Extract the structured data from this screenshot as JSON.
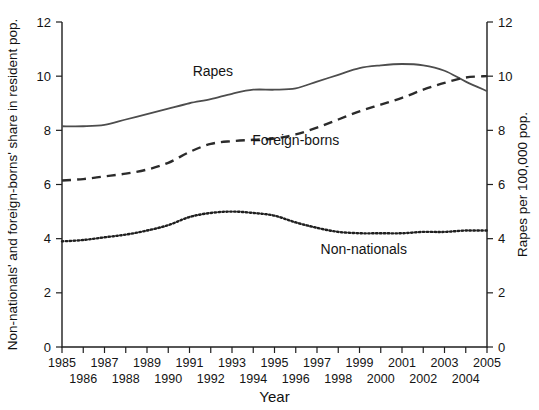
{
  "chart_data": {
    "type": "line",
    "title": "",
    "xlabel": "Year",
    "ylabel": "Non-nationals' and foreign-borns' share in resident pop.",
    "ylabel_right": "Rapes per 100,000 pop.",
    "grid": false,
    "legend_position": "inline-annotations",
    "xlim": [
      1985,
      2005
    ],
    "ylim": [
      0,
      12
    ],
    "ylim_right": [
      0,
      12
    ],
    "yticks": [
      0,
      2,
      4,
      6,
      8,
      10,
      12
    ],
    "yticks_right": [
      0,
      2,
      4,
      6,
      8,
      10,
      12
    ],
    "x": [
      1985,
      1986,
      1987,
      1988,
      1989,
      1990,
      1991,
      1992,
      1993,
      1994,
      1995,
      1996,
      1997,
      1998,
      1999,
      2000,
      2001,
      2002,
      2003,
      2004,
      2005
    ],
    "xticklabels_top": [
      "1985",
      "",
      "1987",
      "",
      "1989",
      "",
      "1991",
      "",
      "1993",
      "",
      "1995",
      "",
      "1997",
      "",
      "1999",
      "",
      "2001",
      "",
      "2003",
      "",
      "2005"
    ],
    "xticklabels_bottom": [
      "",
      "1986",
      "",
      "1988",
      "",
      "1990",
      "",
      "1992",
      "",
      "1994",
      "",
      "1996",
      "",
      "1998",
      "",
      "2000",
      "",
      "2002",
      "",
      "2004",
      ""
    ],
    "series": [
      {
        "name": "Rapes",
        "style": "solid",
        "axis": "right",
        "color": "#4d4d4d",
        "values": [
          8.15,
          8.15,
          8.2,
          8.4,
          8.6,
          8.8,
          9.0,
          9.15,
          9.35,
          9.5,
          9.5,
          9.55,
          9.8,
          10.05,
          10.3,
          10.4,
          10.45,
          10.4,
          10.2,
          9.8,
          9.45
        ]
      },
      {
        "name": "Foreign-borns",
        "style": "dashed",
        "axis": "left",
        "color": "#2b2b2b",
        "values": [
          6.15,
          6.2,
          6.3,
          6.4,
          6.55,
          6.8,
          7.2,
          7.5,
          7.6,
          7.65,
          7.7,
          7.85,
          8.1,
          8.4,
          8.7,
          8.95,
          9.2,
          9.5,
          9.75,
          9.95,
          10.0
        ]
      },
      {
        "name": "Non-nationals",
        "style": "dotted",
        "axis": "left",
        "color": "#1f1f1f",
        "values": [
          3.9,
          3.95,
          4.05,
          4.15,
          4.3,
          4.5,
          4.8,
          4.95,
          5.0,
          4.95,
          4.85,
          4.6,
          4.4,
          4.25,
          4.2,
          4.2,
          4.2,
          4.25,
          4.25,
          4.3,
          4.3
        ]
      }
    ],
    "annotations": [
      {
        "text": "Rapes",
        "x": 1992.1,
        "y_px": 76
      },
      {
        "text": "Foreign-borns",
        "x": 1996.0,
        "y_px": 145
      },
      {
        "text": "Non-nationals",
        "x": 1999.2,
        "y_px": 254
      }
    ]
  }
}
